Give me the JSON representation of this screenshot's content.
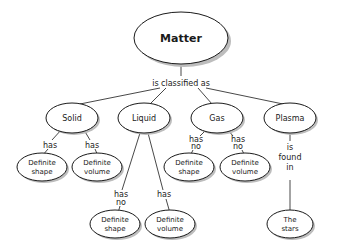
{
  "diagram": {
    "type": "concept-map",
    "root": {
      "label": "Matter"
    },
    "root_link": "is classified as",
    "states": [
      {
        "label": "Solid",
        "link1": "has",
        "link2": "has",
        "child1": [
          "Definite",
          "shape"
        ],
        "child2": [
          "Definite",
          "volume"
        ]
      },
      {
        "label": "Liquid",
        "link1": [
          "has",
          "no"
        ],
        "link2": "has",
        "child1": [
          "Definite",
          "shape"
        ],
        "child2": [
          "Definite",
          "volume"
        ]
      },
      {
        "label": "Gas",
        "link1": [
          "has",
          "no"
        ],
        "link2": [
          "has",
          "no"
        ],
        "child1": [
          "Definite",
          "shape"
        ],
        "child2": [
          "Definite",
          "volume"
        ]
      },
      {
        "label": "Plasma",
        "link1": [
          "is",
          "found",
          "in"
        ],
        "child1": [
          "The",
          "stars"
        ]
      }
    ]
  }
}
